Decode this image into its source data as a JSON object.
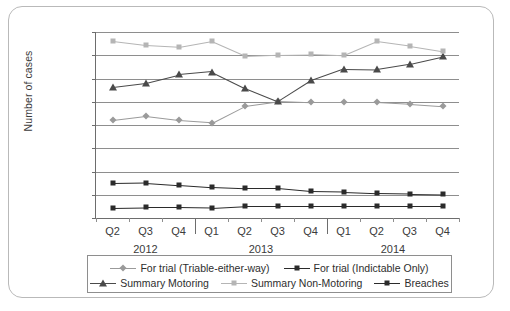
{
  "chart_data": {
    "type": "line",
    "title": "",
    "xlabel": "",
    "ylabel": "Number of cases",
    "ylim": [
      0,
      160000
    ],
    "ytick_step": 20000,
    "ytick_labels": [
      "160,000",
      "140,000",
      "120,000",
      "100,000",
      "80,000",
      "60,000",
      "40,000",
      "20,000",
      "0"
    ],
    "ytick_values": [
      160000,
      140000,
      120000,
      100000,
      80000,
      60000,
      40000,
      20000,
      0
    ],
    "grid": true,
    "legend_position": "bottom",
    "categories": [
      "Q2",
      "Q3",
      "Q4",
      "Q1",
      "Q2",
      "Q3",
      "Q4",
      "Q1",
      "Q2",
      "Q3",
      "Q4"
    ],
    "year_groups": [
      {
        "label": "2012",
        "quarters": [
          "Q2",
          "Q3",
          "Q4"
        ]
      },
      {
        "label": "2013",
        "quarters": [
          "Q1",
          "Q2",
          "Q3",
          "Q4"
        ]
      },
      {
        "label": "2014",
        "quarters": [
          "Q1",
          "Q2",
          "Q3",
          "Q4"
        ]
      }
    ],
    "series": [
      {
        "name": "For trial (Triable-either-way)",
        "marker": "diamond",
        "color": "#9a9a9a",
        "values": [
          84000,
          87500,
          84000,
          82000,
          96500,
          100500,
          99500,
          99500,
          99500,
          98000,
          96000
        ]
      },
      {
        "name": "For trial (Indictable Only)",
        "marker": "square",
        "color": "#2b2b2b",
        "values": [
          9000,
          9500,
          9500,
          9000,
          10500,
          10500,
          10500,
          10500,
          10500,
          10500,
          10500
        ]
      },
      {
        "name": "Summary Motoring",
        "marker": "triangle",
        "color": "#4a4a4a",
        "values": [
          113000,
          116500,
          123500,
          126000,
          112000,
          100500,
          118500,
          128500,
          128000,
          132500,
          139000
        ]
      },
      {
        "name": "Summary Non-Motoring",
        "marker": "square",
        "color": "#b5b5b5",
        "values": [
          152000,
          148500,
          147000,
          152000,
          139500,
          140500,
          141000,
          140000,
          152000,
          148000,
          143500
        ]
      },
      {
        "name": "Breaches",
        "marker": "square",
        "color": "#2b2b2b",
        "values": [
          30000,
          30500,
          28500,
          26500,
          25500,
          25500,
          23000,
          22500,
          21500,
          21000,
          20500
        ]
      }
    ]
  },
  "legend": {
    "rows": [
      [
        "For trial (Triable-either-way)",
        "For trial (Indictable Only)"
      ],
      [
        "Summary Motoring",
        "Summary Non-Motoring",
        "Breaches"
      ]
    ]
  }
}
